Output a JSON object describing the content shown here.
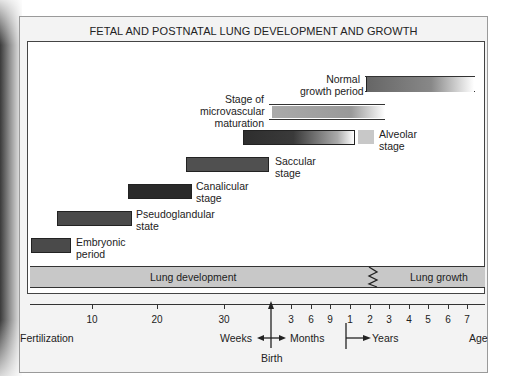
{
  "title": "FETAL AND POSTNATAL LUNG DEVELOPMENT AND GROWTH",
  "colors": {
    "bar_dark": "#3a3a3a",
    "bar_mid": "#555555",
    "bar_light": "#c8c8c8",
    "band": "#c8c8c8",
    "panel_bg": "#f3f3f3"
  },
  "stages": [
    {
      "name": "Embryonic period",
      "line1": "Embryonic",
      "line2": "period",
      "start_week": 0,
      "end_week": 6
    },
    {
      "name": "Pseudoglandular state",
      "line1": "Pseudoglandular",
      "line2": "state",
      "start_week": 4,
      "end_week": 16
    },
    {
      "name": "Canalicular stage",
      "line1": "Canalicular",
      "line2": "stage",
      "start_week": 16,
      "end_week": 26
    },
    {
      "name": "Saccular stage",
      "line1": "Saccular",
      "line2": "stage",
      "start_week": 24,
      "end_week": 36
    },
    {
      "name": "Alveolar stage",
      "line1": "Alveolar",
      "line2": "stage",
      "start": "36 weeks",
      "end": "~1-2 years"
    },
    {
      "name": "Stage of microvascular maturation",
      "line1": "Stage of",
      "line2": "microvascular",
      "line3": "maturation",
      "start": "birth",
      "end": "~3 years"
    },
    {
      "name": "Normal growth period",
      "line1": "Normal",
      "line2": "growth period",
      "start": "~2 years",
      "end": "7+ years"
    }
  ],
  "band": {
    "left_label": "Lung development",
    "right_label": "Lung growth"
  },
  "axis": {
    "weeks_ticks": [
      "10",
      "20",
      "30"
    ],
    "months_ticks": [
      "3",
      "6",
      "9"
    ],
    "years_ticks": [
      "1",
      "2",
      "3",
      "4",
      "5",
      "6",
      "7"
    ],
    "label_fertilization": "Fertilization",
    "label_weeks": "Weeks",
    "label_months": "Months",
    "label_years": "Years",
    "label_age": "Age",
    "label_birth": "Birth"
  }
}
